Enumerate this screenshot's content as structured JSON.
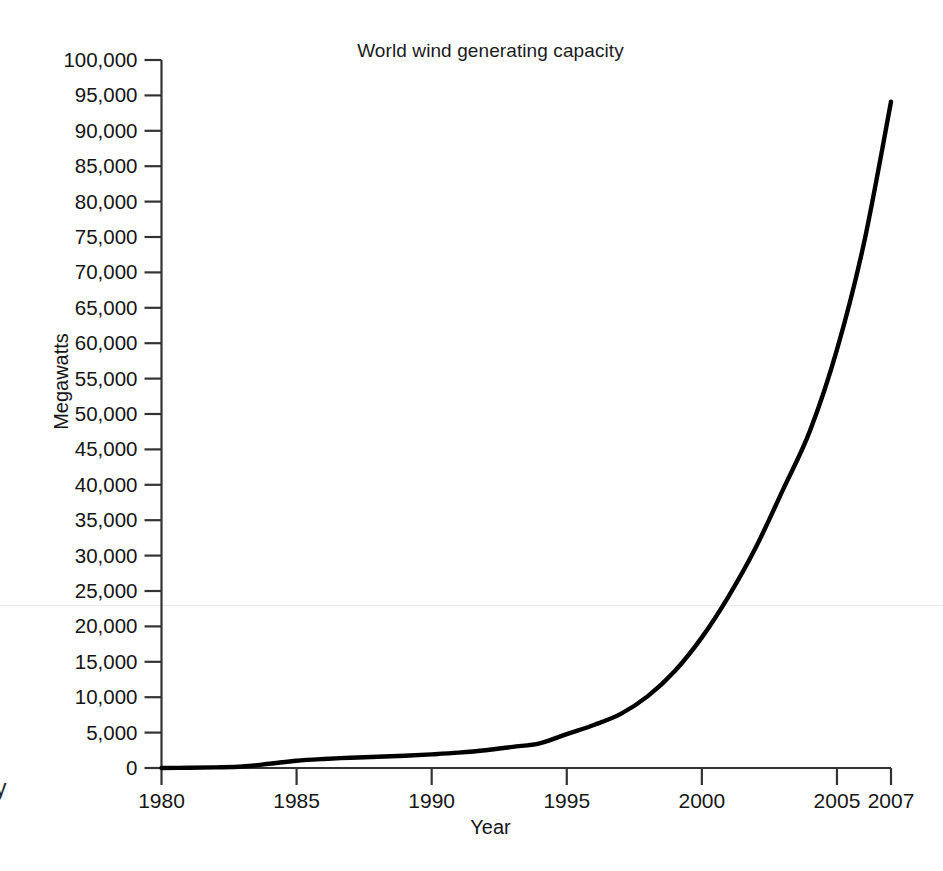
{
  "figure": {
    "title": "World wind generating capacity",
    "background_color": "#ffffff",
    "line_color": "#000000",
    "axis_color": "#333333"
  },
  "axes": {
    "x": {
      "title": "Year",
      "ticks": [
        "1980",
        "1985",
        "1990",
        "1995",
        "2000",
        "2005",
        "2007"
      ],
      "tick_values": [
        1980,
        1985,
        1990,
        1995,
        2000,
        2005,
        2007
      ],
      "range": [
        1980,
        2007
      ]
    },
    "y": {
      "title": "Megawatts",
      "ticks": [
        "0",
        "5,000",
        "10,000",
        "15,000",
        "20,000",
        "25,000",
        "30,000",
        "35,000",
        "40,000",
        "45,000",
        "50,000",
        "55,000",
        "60,000",
        "65,000",
        "70,000",
        "75,000",
        "80,000",
        "85,000",
        "90,000",
        "95,000",
        "100,000"
      ],
      "tick_values": [
        0,
        5000,
        10000,
        15000,
        20000,
        25000,
        30000,
        35000,
        40000,
        45000,
        50000,
        55000,
        60000,
        65000,
        70000,
        75000,
        80000,
        85000,
        90000,
        95000,
        100000
      ],
      "range": [
        0,
        100000
      ]
    }
  },
  "artifacts": {
    "clipped_left_glyph": "y"
  },
  "chart_data": {
    "type": "line",
    "title": "World wind generating capacity",
    "xlabel": "Year",
    "ylabel": "Megawatts",
    "xlim": [
      1980,
      2007
    ],
    "ylim": [
      0,
      100000
    ],
    "grid": false,
    "legend": false,
    "x": [
      1980,
      1981,
      1982,
      1983,
      1984,
      1985,
      1986,
      1987,
      1988,
      1989,
      1990,
      1991,
      1992,
      1993,
      1994,
      1995,
      1996,
      1997,
      1998,
      1999,
      2000,
      2001,
      2002,
      2003,
      2004,
      2005,
      2006,
      2007
    ],
    "series": [
      {
        "name": "World wind generating capacity",
        "values": [
          10,
          25,
          90,
          210,
          600,
          1020,
          1270,
          1450,
          1580,
          1730,
          1930,
          2170,
          2510,
          2990,
          3490,
          4780,
          6070,
          7640,
          10150,
          13700,
          18450,
          24320,
          31180,
          39290,
          47620,
          59090,
          74150,
          94100
        ]
      }
    ]
  }
}
